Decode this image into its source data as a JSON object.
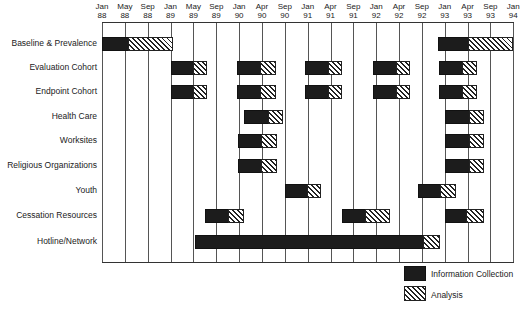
{
  "chart_data": {
    "type": "gantt",
    "title": "",
    "xlabel": "",
    "ylabel": "",
    "x_ticks": [
      {
        "month": "Jan",
        "year": "88"
      },
      {
        "month": "May",
        "year": "88"
      },
      {
        "month": "Sep",
        "year": "88"
      },
      {
        "month": "Jan",
        "year": "89"
      },
      {
        "month": "May",
        "year": "89"
      },
      {
        "month": "Sep",
        "year": "89"
      },
      {
        "month": "Jan",
        "year": "90"
      },
      {
        "month": "Apr",
        "year": "90"
      },
      {
        "month": "Sep",
        "year": "90"
      },
      {
        "month": "Jan",
        "year": "91"
      },
      {
        "month": "Apr",
        "year": "91"
      },
      {
        "month": "Sep",
        "year": "91"
      },
      {
        "month": "Jan",
        "year": "92"
      },
      {
        "month": "Apr",
        "year": "92"
      },
      {
        "month": "Sep",
        "year": "92"
      },
      {
        "month": "Jan",
        "year": "93"
      },
      {
        "month": "Apr",
        "year": "93"
      },
      {
        "month": "Sep",
        "year": "93"
      },
      {
        "month": "Jan",
        "year": "94"
      }
    ],
    "grid": "vertical",
    "legend": {
      "position": "bottom-right",
      "entries": [
        {
          "key": "information_collection",
          "label": "Information Collection",
          "style": "solid-black"
        },
        {
          "key": "analysis",
          "label": "Analysis",
          "style": "diagonal-hatch"
        }
      ]
    },
    "unit_note": "bar positions expressed in tick-column units (0 = Jan 88, 18 = Jan 94)",
    "rows": [
      {
        "label": "Baseline & Prevalence",
        "bars": [
          {
            "start": 0.0,
            "collection_end": 1.15,
            "analysis_end": 3.1
          },
          {
            "start": 14.7,
            "collection_end": 16.0,
            "analysis_end": 18.0
          }
        ]
      },
      {
        "label": "Evaluation Cohort",
        "bars": [
          {
            "start": 3.0,
            "collection_end": 4.0,
            "analysis_end": 4.6
          },
          {
            "start": 5.9,
            "collection_end": 6.9,
            "analysis_end": 7.6
          },
          {
            "start": 8.9,
            "collection_end": 9.9,
            "analysis_end": 10.5
          },
          {
            "start": 11.85,
            "collection_end": 12.85,
            "analysis_end": 13.5
          },
          {
            "start": 14.75,
            "collection_end": 15.75,
            "analysis_end": 16.4
          }
        ]
      },
      {
        "label": "Endpoint Cohort",
        "bars": [
          {
            "start": 3.0,
            "collection_end": 4.0,
            "analysis_end": 4.6
          },
          {
            "start": 5.9,
            "collection_end": 6.9,
            "analysis_end": 7.6
          },
          {
            "start": 8.9,
            "collection_end": 9.9,
            "analysis_end": 10.5
          },
          {
            "start": 11.85,
            "collection_end": 12.85,
            "analysis_end": 13.5
          },
          {
            "start": 14.75,
            "collection_end": 15.75,
            "analysis_end": 16.4
          }
        ]
      },
      {
        "label": "Health Care",
        "bars": [
          {
            "start": 6.2,
            "collection_end": 7.25,
            "analysis_end": 7.9
          },
          {
            "start": 15.0,
            "collection_end": 16.05,
            "analysis_end": 16.7
          }
        ]
      },
      {
        "label": "Worksites",
        "bars": [
          {
            "start": 5.95,
            "collection_end": 6.95,
            "analysis_end": 7.65
          },
          {
            "start": 15.0,
            "collection_end": 16.05,
            "analysis_end": 16.7
          }
        ]
      },
      {
        "label": "Religious Organizations",
        "bars": [
          {
            "start": 5.95,
            "collection_end": 6.95,
            "analysis_end": 7.65
          },
          {
            "start": 15.0,
            "collection_end": 16.05,
            "analysis_end": 16.7
          }
        ]
      },
      {
        "label": "Youth",
        "bars": [
          {
            "start": 8.0,
            "collection_end": 8.95,
            "analysis_end": 9.6
          },
          {
            "start": 13.85,
            "collection_end": 14.8,
            "analysis_end": 15.5
          }
        ]
      },
      {
        "label": "Cessation Resources",
        "bars": [
          {
            "start": 4.5,
            "collection_end": 5.5,
            "analysis_end": 6.2
          },
          {
            "start": 10.5,
            "collection_end": 11.5,
            "analysis_end": 12.6
          },
          {
            "start": 15.0,
            "collection_end": 15.95,
            "analysis_end": 16.7
          }
        ]
      },
      {
        "label": "Hotline/Network",
        "bars": [
          {
            "start": 4.05,
            "collection_end": 14.05,
            "analysis_end": 14.8
          }
        ]
      }
    ]
  }
}
